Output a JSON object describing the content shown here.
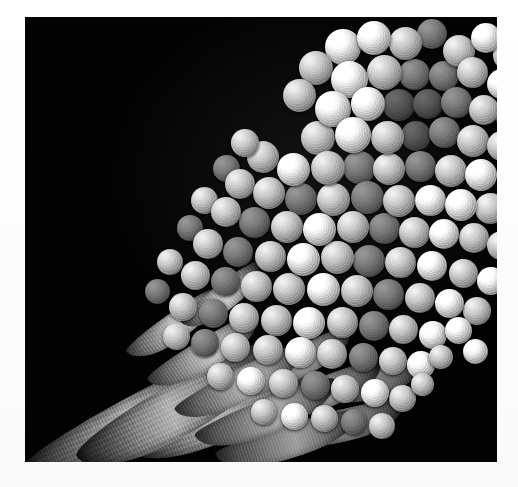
{
  "figure": {
    "kind": "sem-micrograph",
    "alt_text": "Scanning electron micrograph of a fungal conidiophore bearing branched phialides with chains of spherical conidia",
    "background_color": "#020202",
    "border_color": "#fdfdfd",
    "palette": {
      "background": "#020202",
      "paper": "#fdfdfd",
      "spore_highlight": "#f2f2f2",
      "spore_midtone": "#cacaca",
      "spore_shadow": "#4a4a4a",
      "stalk_midtone": "#9a9a9a",
      "stalk_shadow": "#1d1d1d"
    },
    "plate": {
      "left": 25,
      "top": 17,
      "width": 472,
      "height": 445
    },
    "structures": {
      "stalk_label": "conidiophore stalk",
      "phialide_label": "phialide",
      "spore_label": "conidium",
      "cluster_label": "conidial head"
    }
  },
  "stalks": [
    {
      "left": -12,
      "top": 378,
      "width": 250,
      "height": 44,
      "rotate": -28,
      "z": 2
    },
    {
      "left": 42,
      "top": 366,
      "width": 225,
      "height": 52,
      "rotate": -30,
      "z": 3
    },
    {
      "left": 96,
      "top": 372,
      "width": 205,
      "height": 50,
      "rotate": -24,
      "z": 2
    }
  ],
  "phialides": [
    {
      "left": 118,
      "top": 322,
      "width": 126,
      "height": 30,
      "rotate": -31,
      "z": 5,
      "shade": 1.0
    },
    {
      "left": 146,
      "top": 352,
      "width": 142,
      "height": 32,
      "rotate": -27,
      "z": 5,
      "shade": 0.92
    },
    {
      "left": 168,
      "top": 382,
      "width": 150,
      "height": 34,
      "rotate": -22,
      "z": 5,
      "shade": 0.86
    },
    {
      "left": 190,
      "top": 408,
      "width": 148,
      "height": 33,
      "rotate": -17,
      "z": 4,
      "shade": 0.78
    },
    {
      "left": 96,
      "top": 296,
      "width": 108,
      "height": 27,
      "rotate": -35,
      "z": 5,
      "shade": 1.05
    },
    {
      "left": 214,
      "top": 330,
      "width": 120,
      "height": 30,
      "rotate": -26,
      "z": 4,
      "shade": 0.8
    },
    {
      "left": 236,
      "top": 360,
      "width": 126,
      "height": 31,
      "rotate": -21,
      "z": 4,
      "shade": 0.74
    },
    {
      "left": 258,
      "top": 392,
      "width": 124,
      "height": 32,
      "rotate": -14,
      "z": 3,
      "shade": 0.68
    },
    {
      "left": 150,
      "top": 268,
      "width": 96,
      "height": 26,
      "rotate": -38,
      "z": 5,
      "shade": 1.02
    },
    {
      "left": 298,
      "top": 352,
      "width": 104,
      "height": 28,
      "rotate": -18,
      "z": 3,
      "shade": 0.62
    }
  ],
  "spores": [
    {
      "left": 300,
      "top": 12,
      "size": 36,
      "tone": "bright",
      "z": 9
    },
    {
      "left": 332,
      "top": 4,
      "size": 34,
      "tone": "bright",
      "z": 9
    },
    {
      "left": 364,
      "top": 10,
      "size": 33,
      "tone": "normal",
      "z": 8
    },
    {
      "left": 392,
      "top": 2,
      "size": 30,
      "tone": "dim",
      "z": 7
    },
    {
      "left": 418,
      "top": 18,
      "size": 32,
      "tone": "normal",
      "z": 8
    },
    {
      "left": 446,
      "top": 6,
      "size": 30,
      "tone": "bright",
      "z": 9
    },
    {
      "left": 468,
      "top": 24,
      "size": 29,
      "tone": "normal",
      "z": 8
    },
    {
      "left": 274,
      "top": 34,
      "size": 34,
      "tone": "normal",
      "z": 9
    },
    {
      "left": 306,
      "top": 44,
      "size": 37,
      "tone": "bright",
      "z": 10
    },
    {
      "left": 342,
      "top": 38,
      "size": 35,
      "tone": "normal",
      "z": 9
    },
    {
      "left": 374,
      "top": 42,
      "size": 31,
      "tone": "dim",
      "z": 7
    },
    {
      "left": 404,
      "top": 44,
      "size": 30,
      "tone": "dim",
      "z": 7
    },
    {
      "left": 432,
      "top": 40,
      "size": 31,
      "tone": "normal",
      "z": 8
    },
    {
      "left": 462,
      "top": 52,
      "size": 30,
      "tone": "bright",
      "z": 9
    },
    {
      "left": 258,
      "top": 62,
      "size": 33,
      "tone": "normal",
      "z": 9
    },
    {
      "left": 290,
      "top": 74,
      "size": 36,
      "tone": "bright",
      "z": 10
    },
    {
      "left": 326,
      "top": 70,
      "size": 34,
      "tone": "bright",
      "z": 10
    },
    {
      "left": 358,
      "top": 72,
      "size": 32,
      "tone": "dimmer",
      "z": 6
    },
    {
      "left": 388,
      "top": 72,
      "size": 30,
      "tone": "dimmer",
      "z": 6
    },
    {
      "left": 416,
      "top": 70,
      "size": 31,
      "tone": "dim",
      "z": 7
    },
    {
      "left": 444,
      "top": 78,
      "size": 30,
      "tone": "normal",
      "z": 8
    },
    {
      "left": 470,
      "top": 84,
      "size": 28,
      "tone": "dim",
      "z": 7
    },
    {
      "left": 276,
      "top": 104,
      "size": 34,
      "tone": "normal",
      "z": 9
    },
    {
      "left": 310,
      "top": 100,
      "size": 36,
      "tone": "bright",
      "z": 10
    },
    {
      "left": 346,
      "top": 104,
      "size": 33,
      "tone": "normal",
      "z": 9
    },
    {
      "left": 376,
      "top": 104,
      "size": 30,
      "tone": "dimmer",
      "z": 6
    },
    {
      "left": 404,
      "top": 100,
      "size": 31,
      "tone": "dim",
      "z": 7
    },
    {
      "left": 432,
      "top": 108,
      "size": 32,
      "tone": "normal",
      "z": 8
    },
    {
      "left": 462,
      "top": 114,
      "size": 30,
      "tone": "normal",
      "z": 8
    },
    {
      "left": 222,
      "top": 124,
      "size": 32,
      "tone": "normal",
      "z": 9
    },
    {
      "left": 252,
      "top": 136,
      "size": 33,
      "tone": "bright",
      "z": 10
    },
    {
      "left": 286,
      "top": 134,
      "size": 34,
      "tone": "normal",
      "z": 9
    },
    {
      "left": 318,
      "top": 134,
      "size": 33,
      "tone": "dim",
      "z": 7
    },
    {
      "left": 348,
      "top": 136,
      "size": 32,
      "tone": "normal",
      "z": 8
    },
    {
      "left": 380,
      "top": 134,
      "size": 31,
      "tone": "dim",
      "z": 7
    },
    {
      "left": 410,
      "top": 138,
      "size": 32,
      "tone": "normal",
      "z": 8
    },
    {
      "left": 440,
      "top": 142,
      "size": 32,
      "tone": "bright",
      "z": 10
    },
    {
      "left": 200,
      "top": 152,
      "size": 30,
      "tone": "normal",
      "z": 9
    },
    {
      "left": 228,
      "top": 160,
      "size": 32,
      "tone": "normal",
      "z": 9
    },
    {
      "left": 260,
      "top": 166,
      "size": 32,
      "tone": "dim",
      "z": 7
    },
    {
      "left": 292,
      "top": 166,
      "size": 33,
      "tone": "normal",
      "z": 8
    },
    {
      "left": 326,
      "top": 164,
      "size": 33,
      "tone": "dim",
      "z": 7
    },
    {
      "left": 358,
      "top": 168,
      "size": 32,
      "tone": "normal",
      "z": 8
    },
    {
      "left": 390,
      "top": 168,
      "size": 31,
      "tone": "bright",
      "z": 10
    },
    {
      "left": 420,
      "top": 172,
      "size": 32,
      "tone": "bright",
      "z": 10
    },
    {
      "left": 450,
      "top": 176,
      "size": 31,
      "tone": "normal",
      "z": 8
    },
    {
      "left": 186,
      "top": 180,
      "size": 30,
      "tone": "normal",
      "z": 9
    },
    {
      "left": 214,
      "top": 190,
      "size": 31,
      "tone": "dim",
      "z": 7
    },
    {
      "left": 246,
      "top": 194,
      "size": 32,
      "tone": "normal",
      "z": 8
    },
    {
      "left": 278,
      "top": 196,
      "size": 33,
      "tone": "bright",
      "z": 10
    },
    {
      "left": 312,
      "top": 194,
      "size": 32,
      "tone": "normal",
      "z": 8
    },
    {
      "left": 344,
      "top": 196,
      "size": 31,
      "tone": "dim",
      "z": 7
    },
    {
      "left": 374,
      "top": 200,
      "size": 31,
      "tone": "normal",
      "z": 8
    },
    {
      "left": 404,
      "top": 202,
      "size": 30,
      "tone": "bright",
      "z": 10
    },
    {
      "left": 434,
      "top": 206,
      "size": 30,
      "tone": "normal",
      "z": 8
    },
    {
      "left": 462,
      "top": 214,
      "size": 29,
      "tone": "normal",
      "z": 8
    },
    {
      "left": 168,
      "top": 212,
      "size": 30,
      "tone": "normal",
      "z": 9
    },
    {
      "left": 198,
      "top": 220,
      "size": 30,
      "tone": "dim",
      "z": 7
    },
    {
      "left": 230,
      "top": 224,
      "size": 31,
      "tone": "normal",
      "z": 8
    },
    {
      "left": 262,
      "top": 226,
      "size": 33,
      "tone": "bright",
      "z": 10
    },
    {
      "left": 296,
      "top": 224,
      "size": 33,
      "tone": "normal",
      "z": 8
    },
    {
      "left": 328,
      "top": 228,
      "size": 32,
      "tone": "dim",
      "z": 7
    },
    {
      "left": 360,
      "top": 230,
      "size": 31,
      "tone": "normal",
      "z": 8
    },
    {
      "left": 392,
      "top": 234,
      "size": 30,
      "tone": "bright",
      "z": 10
    },
    {
      "left": 424,
      "top": 242,
      "size": 29,
      "tone": "normal",
      "z": 8
    },
    {
      "left": 452,
      "top": 250,
      "size": 28,
      "tone": "bright",
      "z": 10
    },
    {
      "left": 156,
      "top": 244,
      "size": 29,
      "tone": "normal",
      "z": 9
    },
    {
      "left": 186,
      "top": 250,
      "size": 29,
      "tone": "dim",
      "z": 7
    },
    {
      "left": 216,
      "top": 254,
      "size": 31,
      "tone": "normal",
      "z": 8
    },
    {
      "left": 248,
      "top": 256,
      "size": 32,
      "tone": "normal",
      "z": 8
    },
    {
      "left": 282,
      "top": 256,
      "size": 33,
      "tone": "bright",
      "z": 10
    },
    {
      "left": 316,
      "top": 258,
      "size": 32,
      "tone": "normal",
      "z": 8
    },
    {
      "left": 348,
      "top": 262,
      "size": 31,
      "tone": "dim",
      "z": 7
    },
    {
      "left": 380,
      "top": 266,
      "size": 30,
      "tone": "normal",
      "z": 8
    },
    {
      "left": 410,
      "top": 272,
      "size": 29,
      "tone": "bright",
      "z": 10
    },
    {
      "left": 438,
      "top": 280,
      "size": 28,
      "tone": "normal",
      "z": 8
    },
    {
      "left": 144,
      "top": 276,
      "size": 28,
      "tone": "normal",
      "z": 9
    },
    {
      "left": 174,
      "top": 282,
      "size": 29,
      "tone": "dim",
      "z": 7
    },
    {
      "left": 204,
      "top": 286,
      "size": 30,
      "tone": "normal",
      "z": 8
    },
    {
      "left": 236,
      "top": 288,
      "size": 31,
      "tone": "normal",
      "z": 8
    },
    {
      "left": 268,
      "top": 290,
      "size": 32,
      "tone": "bright",
      "z": 10
    },
    {
      "left": 302,
      "top": 290,
      "size": 31,
      "tone": "normal",
      "z": 8
    },
    {
      "left": 334,
      "top": 294,
      "size": 30,
      "tone": "dim",
      "z": 7
    },
    {
      "left": 364,
      "top": 298,
      "size": 29,
      "tone": "normal",
      "z": 8
    },
    {
      "left": 394,
      "top": 304,
      "size": 28,
      "tone": "bright",
      "z": 10
    },
    {
      "left": 138,
      "top": 306,
      "size": 27,
      "tone": "normal",
      "z": 9
    },
    {
      "left": 166,
      "top": 312,
      "size": 28,
      "tone": "dim",
      "z": 7
    },
    {
      "left": 196,
      "top": 316,
      "size": 29,
      "tone": "normal",
      "z": 8
    },
    {
      "left": 228,
      "top": 318,
      "size": 30,
      "tone": "normal",
      "z": 8
    },
    {
      "left": 260,
      "top": 320,
      "size": 31,
      "tone": "bright",
      "z": 10
    },
    {
      "left": 292,
      "top": 322,
      "size": 30,
      "tone": "normal",
      "z": 8
    },
    {
      "left": 324,
      "top": 326,
      "size": 29,
      "tone": "dim",
      "z": 7
    },
    {
      "left": 354,
      "top": 330,
      "size": 28,
      "tone": "normal",
      "z": 8
    },
    {
      "left": 382,
      "top": 334,
      "size": 28,
      "tone": "bright",
      "z": 10
    },
    {
      "left": 182,
      "top": 346,
      "size": 27,
      "tone": "normal",
      "z": 8
    },
    {
      "left": 212,
      "top": 350,
      "size": 28,
      "tone": "bright",
      "z": 10
    },
    {
      "left": 244,
      "top": 352,
      "size": 29,
      "tone": "normal",
      "z": 8
    },
    {
      "left": 276,
      "top": 354,
      "size": 29,
      "tone": "dim",
      "z": 7
    },
    {
      "left": 306,
      "top": 358,
      "size": 28,
      "tone": "normal",
      "z": 8
    },
    {
      "left": 336,
      "top": 362,
      "size": 28,
      "tone": "bright",
      "z": 10
    },
    {
      "left": 364,
      "top": 368,
      "size": 27,
      "tone": "normal",
      "z": 8
    },
    {
      "left": 226,
      "top": 382,
      "size": 26,
      "tone": "normal",
      "z": 8
    },
    {
      "left": 256,
      "top": 386,
      "size": 27,
      "tone": "bright",
      "z": 10
    },
    {
      "left": 286,
      "top": 388,
      "size": 27,
      "tone": "normal",
      "z": 8
    },
    {
      "left": 316,
      "top": 392,
      "size": 26,
      "tone": "dim",
      "z": 7
    },
    {
      "left": 344,
      "top": 396,
      "size": 26,
      "tone": "normal",
      "z": 8
    },
    {
      "left": 420,
      "top": 300,
      "size": 27,
      "tone": "bright",
      "z": 11
    },
    {
      "left": 438,
      "top": 322,
      "size": 25,
      "tone": "bright",
      "z": 11
    },
    {
      "left": 404,
      "top": 328,
      "size": 24,
      "tone": "normal",
      "z": 10
    },
    {
      "left": 386,
      "top": 356,
      "size": 23,
      "tone": "normal",
      "z": 10
    },
    {
      "left": 206,
      "top": 112,
      "size": 28,
      "tone": "normal",
      "z": 9
    },
    {
      "left": 188,
      "top": 138,
      "size": 27,
      "tone": "dim",
      "z": 7
    },
    {
      "left": 166,
      "top": 170,
      "size": 27,
      "tone": "normal",
      "z": 8
    },
    {
      "left": 152,
      "top": 198,
      "size": 26,
      "tone": "dim",
      "z": 7
    },
    {
      "left": 132,
      "top": 232,
      "size": 26,
      "tone": "normal",
      "z": 8
    },
    {
      "left": 120,
      "top": 262,
      "size": 25,
      "tone": "dim",
      "z": 7
    }
  ]
}
